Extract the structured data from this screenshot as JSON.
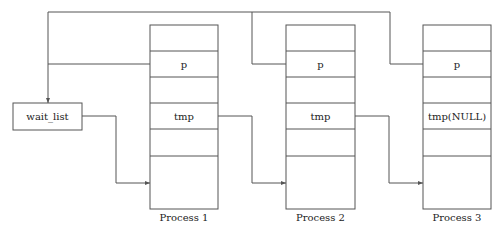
{
  "diagram": {
    "type": "linked-list-of-processes",
    "head": {
      "label": "wait_list"
    },
    "processes": [
      {
        "name": "Process 1",
        "fields": [
          "",
          "p",
          "",
          "tmp",
          "",
          ""
        ]
      },
      {
        "name": "Process 2",
        "fields": [
          "",
          "p",
          "",
          "tmp",
          "",
          ""
        ]
      },
      {
        "name": "Process 3",
        "fields": [
          "",
          "p",
          "",
          "tmp(NULL)",
          "",
          ""
        ]
      }
    ],
    "edges": [
      {
        "from": "wait_list",
        "to": "Process 1"
      },
      {
        "from": "Process 1.tmp",
        "to": "Process 2"
      },
      {
        "from": "Process 2.tmp",
        "to": "Process 3"
      },
      {
        "from": "Process 1.p",
        "to": "wait_list"
      },
      {
        "from": "Process 2.p",
        "to": "wait_list"
      },
      {
        "from": "Process 3.p",
        "to": "wait_list"
      }
    ],
    "colors": {
      "line": "#555555",
      "text": "#222222",
      "background": "#ffffff"
    }
  }
}
